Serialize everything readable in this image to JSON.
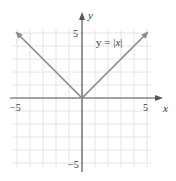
{
  "chart_data": {
    "type": "line",
    "title": "",
    "xlabel": "x",
    "ylabel": "y",
    "xlim": [
      -5,
      5
    ],
    "ylim": [
      -5,
      5
    ],
    "grid": true,
    "grid_step": 1,
    "x_tick_labels": [
      "-5",
      "5"
    ],
    "y_tick_labels": [
      "5",
      "-5"
    ],
    "series": [
      {
        "name": "y = |x|",
        "x": [
          -5,
          -4,
          -3,
          -2,
          -1,
          0,
          1,
          2,
          3,
          4,
          5
        ],
        "y": [
          5,
          4,
          3,
          2,
          1,
          0,
          1,
          2,
          3,
          4,
          5
        ],
        "color": "#8a8a8a",
        "arrows_at_ends": true
      }
    ],
    "annotations": [
      {
        "text": "y = |x|",
        "x": 2.4,
        "y": 4.0
      }
    ]
  },
  "labels": {
    "x_axis": "x",
    "y_axis": "y",
    "x_min": "−5",
    "x_max": "5",
    "y_max": "5",
    "y_min": "−5",
    "equation_prefix": "y = |",
    "equation_var": "x",
    "equation_suffix": "|"
  },
  "colors": {
    "grid": "#e4e4e4",
    "axis": "#555555",
    "curve": "#8a8a8a",
    "text": "#333333"
  }
}
